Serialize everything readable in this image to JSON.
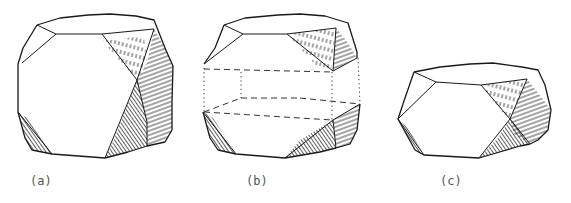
{
  "figure": {
    "panels": [
      {
        "id": "a",
        "label": "(a)",
        "description": "Equant crystal: large square front face with truncated (octahedral) corners; shaded faces on right side"
      },
      {
        "id": "b",
        "label": "(b)",
        "description": "Same crystal with a horizontal slab indicated by dotted/dashed lines across the middle"
      },
      {
        "id": "c",
        "label": "(c)",
        "description": "Flattened (tabular) crystal after the middle slab is removed"
      }
    ],
    "colors": {
      "line": "#1a1a1a",
      "background": "#ffffff",
      "label": "#555555"
    }
  }
}
